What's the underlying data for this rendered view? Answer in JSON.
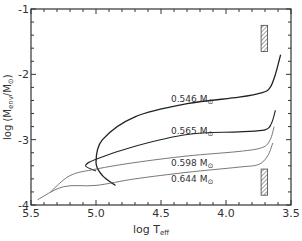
{
  "chart_data": {
    "type": "line",
    "title": "",
    "xlabel": "log T_eff",
    "ylabel": "log (M_env / M_⊙)",
    "xlim": [
      5.5,
      3.5
    ],
    "ylim": [
      -4,
      -1
    ],
    "x_inverted": true,
    "grid": false,
    "legend": "none (inline curve labels)",
    "x_ticks": [
      "5.5",
      "5.0",
      "4.5",
      "4.0",
      "3.5"
    ],
    "y_ticks": [
      "-1",
      "-2",
      "-3",
      "-4"
    ],
    "series": [
      {
        "name": "0.546 M⊙",
        "points": [
          [
            3.58,
            -1.7
          ],
          [
            3.62,
            -2.0
          ],
          [
            3.66,
            -2.2
          ],
          [
            3.72,
            -2.28
          ],
          [
            3.9,
            -2.35
          ],
          [
            4.3,
            -2.45
          ],
          [
            4.7,
            -2.65
          ],
          [
            4.95,
            -3.0
          ],
          [
            5.0,
            -3.35
          ],
          [
            4.95,
            -3.55
          ],
          [
            4.85,
            -3.7
          ]
        ]
      },
      {
        "name": "0.565 M⊙",
        "points": [
          [
            3.62,
            -2.55
          ],
          [
            3.65,
            -2.75
          ],
          [
            3.7,
            -2.85
          ],
          [
            3.9,
            -2.88
          ],
          [
            4.3,
            -2.92
          ],
          [
            4.7,
            -3.1
          ],
          [
            5.0,
            -3.3
          ],
          [
            5.08,
            -3.4
          ],
          [
            5.0,
            -3.48
          ]
        ]
      },
      {
        "name": "0.598 M⊙",
        "points": [
          [
            3.63,
            -2.8
          ],
          [
            3.66,
            -3.0
          ],
          [
            3.72,
            -3.12
          ],
          [
            3.9,
            -3.18
          ],
          [
            4.3,
            -3.25
          ],
          [
            4.7,
            -3.35
          ],
          [
            5.0,
            -3.45
          ],
          [
            5.2,
            -3.55
          ],
          [
            5.35,
            -3.8
          ]
        ]
      },
      {
        "name": "0.644 M⊙",
        "points": [
          [
            3.64,
            -3.05
          ],
          [
            3.68,
            -3.25
          ],
          [
            3.75,
            -3.38
          ],
          [
            3.9,
            -3.42
          ],
          [
            4.3,
            -3.5
          ],
          [
            4.7,
            -3.6
          ],
          [
            5.0,
            -3.7
          ],
          [
            5.25,
            -3.72
          ],
          [
            5.45,
            -3.92
          ]
        ]
      }
    ],
    "annotations": [
      {
        "type": "hatched-box",
        "x": [
          3.73,
          3.68
        ],
        "y": [
          -1.25,
          -1.65
        ],
        "note": "upper hatched region"
      },
      {
        "type": "hatched-box",
        "x": [
          3.73,
          3.68
        ],
        "y": [
          -3.45,
          -3.85
        ],
        "note": "lower hatched region"
      }
    ]
  },
  "labels": {
    "xlabel_main": "log T",
    "xlabel_sub": "eff",
    "ylabel_text": "log (M",
    "ylabel_sub": "env",
    "ylabel_mid": "/M",
    "ylabel_sub2": "⊙",
    "ylabel_end": ")",
    "curve_0": "0.546 M",
    "curve_1": "0.565 M",
    "curve_2": "0.598 M",
    "curve_3": "0.644 M",
    "sun": "⊙"
  }
}
